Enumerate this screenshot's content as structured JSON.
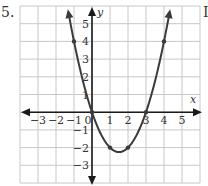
{
  "problem": {
    "number": "5.",
    "right_mark": "I"
  },
  "chart_data": {
    "type": "line",
    "title": "",
    "xlabel": "x",
    "ylabel": "y",
    "xlim": [
      -4,
      6
    ],
    "ylim": [
      -4,
      6
    ],
    "grid": true,
    "x_ticks": [
      "-3",
      "-2",
      "-1",
      "0",
      "1",
      "2",
      "3",
      "4",
      "5"
    ],
    "y_ticks": [
      "5",
      "4",
      "3",
      "2",
      "1",
      "-1",
      "-2",
      "-3"
    ],
    "series": [
      {
        "name": "parabola y = x^2 - 3x",
        "points": [
          [
            -1,
            4
          ],
          [
            0,
            0
          ],
          [
            1,
            -2
          ],
          [
            2,
            -2
          ],
          [
            3,
            0
          ],
          [
            4,
            4
          ]
        ],
        "marked_points": [
          [
            -1,
            4
          ],
          [
            0,
            0
          ],
          [
            1,
            -2
          ],
          [
            2,
            -2
          ],
          [
            3,
            0
          ],
          [
            4,
            4
          ]
        ],
        "vertex": [
          1.5,
          -2.25
        ],
        "arrows_at_ends": true
      }
    ],
    "colors": {
      "grid": "#c8c8c8",
      "curve": "#3a3a3a",
      "axis": "#1a1a1a"
    }
  }
}
